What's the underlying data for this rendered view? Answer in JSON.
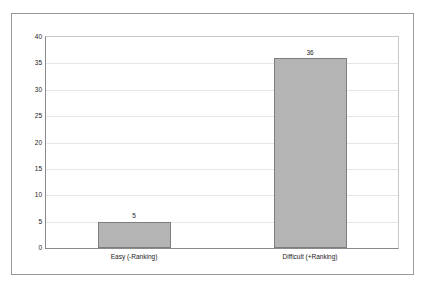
{
  "chart_data": {
    "type": "bar",
    "title": "",
    "subtitle": "",
    "xlabel": "",
    "ylabel": "",
    "categories": [
      "Easy (-Ranking)",
      "Difficult (+Ranking)"
    ],
    "values": [
      5,
      36
    ],
    "data_labels": [
      "5",
      "36"
    ],
    "ylim": [
      0,
      40
    ],
    "ytick_step": 5,
    "ytick_labels": [
      "0",
      "5",
      "10",
      "15",
      "20",
      "25",
      "30",
      "35",
      "40"
    ],
    "ytick_values": [
      0,
      5,
      10,
      15,
      20,
      25,
      30,
      35,
      40
    ],
    "grid": {
      "horizontal": true,
      "vertical": false,
      "color": "#e6e6e6"
    },
    "legend": {
      "visible": false,
      "position": "none",
      "entries": []
    },
    "series": [
      {
        "name": "",
        "values": [
          5,
          36
        ],
        "bar_fill_color": "#b4b4b4",
        "bar_border_color": "#7e7e7e"
      }
    ],
    "axis_line_color": "#8a8a8a",
    "plot_border_color": "#c8c8c8",
    "frame_border_color": "#9a9a9a",
    "background_color": "#ffffff",
    "text_color": "#1a1a1a"
  }
}
